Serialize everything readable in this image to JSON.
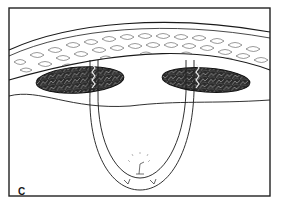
{
  "figure": {
    "panel_label": "C",
    "colors": {
      "background": "#ffffff",
      "line": "#1a1a1a",
      "muscle_fill": "#2a2a2a",
      "muscle_highlight": "#8a8a8a",
      "frame": "#222222"
    },
    "elements": {
      "frame": "rectangular border",
      "fat_layer": "upper curved band with cellular (adipose) texture",
      "muscle_left": "dark oval muscle mass, left",
      "muscle_right": "dark oval muscle mass, right",
      "fascia_line": "curved line beneath muscles",
      "sling": "U-shaped loop passing through both muscles",
      "suture_knot": "knot detail at bottom of loop with small arrows"
    }
  }
}
